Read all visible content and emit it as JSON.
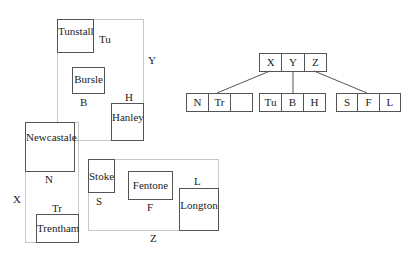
{
  "regions": {
    "X": {
      "label": "X"
    },
    "Y": {
      "label": "Y"
    },
    "Z": {
      "label": "Z"
    }
  },
  "places": {
    "tunstall": {
      "name": "Tunstall",
      "code": "Tu"
    },
    "bursle": {
      "name": "Bursle",
      "code": "B"
    },
    "hanley": {
      "name": "Hanley",
      "code": "H"
    },
    "newcastale": {
      "name": "Newcastale",
      "code": "N"
    },
    "trentham": {
      "name": "Trentham",
      "code": "Tr"
    },
    "stoke": {
      "name": "Stoke",
      "code": "S"
    },
    "fentone": {
      "name": "Fentone",
      "code": "F"
    },
    "longton": {
      "name": "Longton",
      "code": "L"
    }
  },
  "tree": {
    "root": [
      "X",
      "Y",
      "Z"
    ],
    "leaves": [
      [
        "N",
        "Tr",
        ""
      ],
      [
        "Tu",
        "B",
        "H"
      ],
      [
        "S",
        "F",
        "L"
      ]
    ]
  }
}
